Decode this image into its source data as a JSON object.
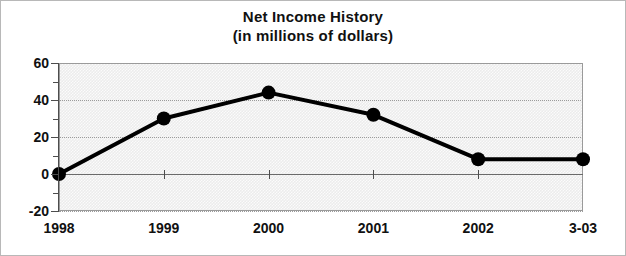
{
  "chart_data": {
    "type": "line",
    "title": "Net Income History",
    "subtitle": "(in millions of dollars)",
    "xlabel": "",
    "ylabel": "",
    "categories": [
      "1998",
      "1999",
      "2000",
      "2001",
      "2002",
      "3-03"
    ],
    "values": [
      0,
      30,
      44,
      32,
      8,
      8
    ],
    "ylim": [
      -20,
      60
    ],
    "yticks": [
      60,
      40,
      20,
      0,
      -20
    ],
    "ytick_labels": [
      "60",
      "40",
      "20",
      "0",
      "-20"
    ],
    "yminor_ticks": [
      50,
      30,
      10,
      -10
    ],
    "grid": true,
    "grid_axis": "y",
    "legend": "none",
    "series": [
      {
        "name": "Net Income",
        "values": [
          0,
          30,
          44,
          32,
          8,
          8
        ],
        "color": "#000000",
        "marker": "circle",
        "line_width": 4
      }
    ],
    "colors": {
      "line": "#000000",
      "marker": "#000000",
      "plot_background": "#ececec",
      "grid": "#9b9b9b",
      "axis": "#4d4d4d",
      "text": "#111111",
      "frame": "#b8b8b8"
    }
  },
  "title": {
    "line1": "Net Income History",
    "line2": "(in millions of dollars)"
  }
}
